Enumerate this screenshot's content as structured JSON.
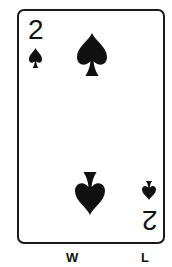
{
  "card": {
    "rank": "2",
    "suit": "spades",
    "suit_icon": "spade-icon",
    "suit_color": "#111111",
    "border_color": "#1a1a1a",
    "background": "#ffffff"
  },
  "labels": {
    "left": "W",
    "right": "L"
  }
}
